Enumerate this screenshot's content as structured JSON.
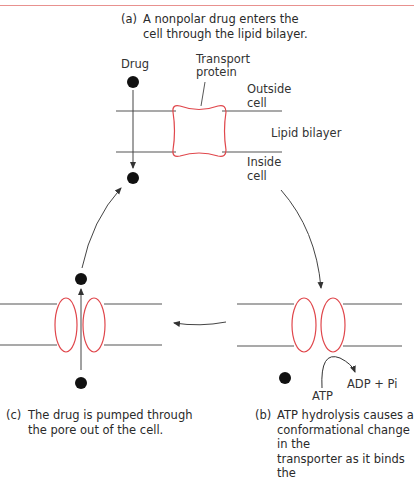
{
  "captions": {
    "a": {
      "tag": "(a)",
      "text": "A nonpolar drug enters the\ncell through the lipid bilayer."
    },
    "b": {
      "tag": "(b)",
      "text": "ATP hydrolysis causes a\nconformational change in the\ntransporter as it binds the"
    },
    "c": {
      "tag": "(c)",
      "text": "The drug is pumped through\nthe pore out of the cell."
    }
  },
  "labels": {
    "drug": "Drug",
    "transport_protein": "Transport\nprotein",
    "outside_cell": "Outside\ncell",
    "lipid_bilayer": "Lipid bilayer",
    "inside_cell": "Inside\ncell",
    "atp": "ATP",
    "adp_pi": "ADP + Pi"
  },
  "colors": {
    "protein_outline": "#e0474c",
    "membrane": "#555555",
    "drug": "#111111",
    "arrow": "#333333",
    "top_rule": "#e8918f"
  }
}
